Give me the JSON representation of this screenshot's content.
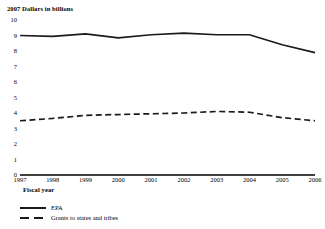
{
  "chart_data": {
    "type": "line",
    "title": "",
    "ylabel": "2007 Dollars in billions",
    "xlabel": "Fiscal year",
    "categories": [
      1997,
      1998,
      1999,
      2000,
      2001,
      2002,
      2003,
      2004,
      2005,
      2006
    ],
    "x_tick_labels": [
      "1997",
      "1998",
      "1999",
      "2000",
      "2001",
      "2002",
      "2003",
      "2004",
      "2005",
      "2006"
    ],
    "y_tick_labels": [
      "0",
      "1",
      "2",
      "3",
      "4",
      "5",
      "6",
      "7",
      "8",
      "9",
      "10"
    ],
    "ylim": [
      0,
      10
    ],
    "grid": false,
    "legend_position": "bottom-left",
    "series": [
      {
        "name": "EPA",
        "style": "solid",
        "color": "#1a1a1a",
        "values": [
          9.0,
          8.95,
          9.1,
          8.85,
          9.05,
          9.15,
          9.05,
          9.05,
          8.4,
          7.9
        ]
      },
      {
        "name": "Grants to states and tribes",
        "style": "dashed",
        "color": "#1a1a1a",
        "values": [
          3.5,
          3.65,
          3.85,
          3.9,
          3.95,
          4.0,
          4.1,
          4.05,
          3.7,
          3.5
        ]
      }
    ]
  },
  "legend": {
    "items": [
      {
        "label": "EPA",
        "style": "solid"
      },
      {
        "label": "Grants to states and tribes",
        "style": "dashed"
      }
    ]
  },
  "colors": {
    "line": "#1a1a1a",
    "axis": "#000000",
    "background": "#ffffff"
  }
}
